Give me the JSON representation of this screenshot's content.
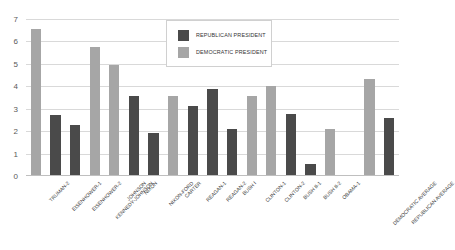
{
  "chart_data": {
    "type": "bar",
    "title": "",
    "xlabel": "",
    "ylabel": "",
    "ylim": [
      0,
      7
    ],
    "yticks": [
      0,
      1,
      2,
      3,
      4,
      5,
      6,
      7
    ],
    "grid": true,
    "legend_position": "top-center",
    "categories": [
      "TRUMAN-2",
      "EISENHOWER-1",
      "EISENHOWER-2",
      "KENNEDY-JOHNSON",
      "JOHNSON",
      "NIXON",
      "NIXON-FORD",
      "CARTER",
      "REAGAN-1",
      "REAGAN-2",
      "BUSH I",
      "CLINTON-1",
      "CLINTON-2",
      "BUSH II-1",
      "BUSH II-2",
      "OBAMA-1",
      "",
      "DEMOCRATIC AVERAGE",
      "REPUBLICAN AVERAGE"
    ],
    "party": [
      "democratic",
      "republican",
      "republican",
      "democratic",
      "democratic",
      "republican",
      "republican",
      "democratic",
      "republican",
      "republican",
      "republican",
      "democratic",
      "democratic",
      "republican",
      "republican",
      "democratic",
      "none",
      "democratic",
      "republican"
    ],
    "values": [
      6.55,
      2.7,
      2.25,
      5.75,
      4.95,
      3.55,
      1.9,
      3.55,
      3.1,
      3.88,
      2.05,
      3.55,
      4.0,
      2.75,
      0.5,
      2.05,
      null,
      4.33,
      2.55
    ],
    "series": [
      {
        "name": "REPUBLICAN PRESIDENT",
        "color": "#4a4a4a",
        "values": [
          null,
          2.7,
          2.25,
          null,
          null,
          3.55,
          1.9,
          null,
          3.1,
          3.88,
          2.05,
          null,
          null,
          2.75,
          0.5,
          null,
          null,
          null,
          2.55
        ]
      },
      {
        "name": "DEMOCRATIC PRESIDENT",
        "color": "#a6a6a6",
        "values": [
          6.55,
          null,
          null,
          5.75,
          4.95,
          null,
          null,
          3.55,
          null,
          null,
          null,
          3.55,
          4.0,
          null,
          null,
          2.05,
          null,
          4.33,
          null
        ]
      }
    ]
  },
  "legend": {
    "items": [
      {
        "label": "REPUBLICAN PRESIDENT",
        "color": "#4a4a4a"
      },
      {
        "label": "DEMOCRATIC PRESIDENT",
        "color": "#a6a6a6"
      }
    ]
  },
  "colors": {
    "republican": "#4a4a4a",
    "democratic": "#a6a6a6",
    "gridline": "#d9d9d9",
    "axis": "#bfbfbf",
    "tick_text": "#595959",
    "label_text": "#404040",
    "background": "#ffffff"
  }
}
